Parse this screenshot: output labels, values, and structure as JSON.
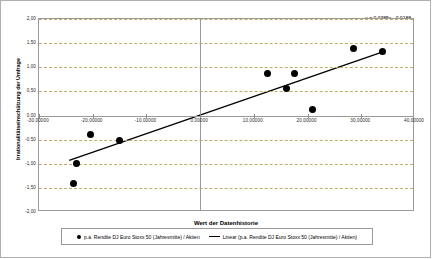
{
  "chart_data": {
    "type": "scatter",
    "title": "",
    "xlabel": "Wert der Datenhistorie",
    "ylabel": "Irrationalitätseinschätzung der Umfrage",
    "xlim": [
      -30,
      40
    ],
    "ylim": [
      -2.0,
      2.0
    ],
    "grid": true,
    "legend_position": "bottom",
    "xticks": [
      "-30,00000",
      "-20,00000",
      "-10,00000",
      "0,00000",
      "10,00000",
      "20,00000",
      "30,00000",
      "40,00000"
    ],
    "xtick_values": [
      -30,
      -20,
      -10,
      0,
      10,
      20,
      30,
      40
    ],
    "yticks": [
      "2,00",
      "1,50",
      "1,00",
      "0,50",
      "0,00",
      "-0,50",
      "-1,00",
      "-1,50",
      "-2,00"
    ],
    "ytick_values": [
      2.0,
      1.5,
      1.0,
      0.5,
      0.0,
      -0.5,
      -1.0,
      -1.5,
      -2.0
    ],
    "series": [
      {
        "name": "p.a. Rendite DJ Euro Stoxx 50 (Jahresmitte) / Aktien",
        "type": "scatter",
        "marker": "circle",
        "color": "#000000",
        "points": [
          {
            "x": -23.5,
            "y": -1.4
          },
          {
            "x": -23.0,
            "y": -1.0
          },
          {
            "x": -20.5,
            "y": -0.4
          },
          {
            "x": -15.0,
            "y": -0.52
          },
          {
            "x": 12.5,
            "y": 0.87
          },
          {
            "x": 16.0,
            "y": 0.55
          },
          {
            "x": 17.5,
            "y": 0.87
          },
          {
            "x": 21.0,
            "y": 0.12
          },
          {
            "x": 28.5,
            "y": 1.38
          },
          {
            "x": 34.0,
            "y": 1.32
          }
        ]
      },
      {
        "name": "Linear (p.a. Rendite DJ Euro Stoxx 50 (Jahresmitte) / Aktien)",
        "type": "line",
        "color": "#000000",
        "slope": 0.0385,
        "intercept": -0.0188,
        "x_start": -24.5,
        "x_end": 34.5
      }
    ],
    "annotations": {
      "equation": "y = 0,0385x - 0,0188",
      "r_squared_prefix": "R",
      "r_squared_exponent": "2",
      "r_squared_value": " = 0,8285"
    }
  },
  "legend": {
    "entries": [
      {
        "marker": "circle",
        "label": "p.a. Rendite DJ Euro Stoxx 50 (Jahresmitte) / Aktien"
      },
      {
        "marker": "line",
        "label": "Linear (p.a. Rendite DJ Euro Stoxx 50 (Jahresmitte) / Aktien)"
      }
    ]
  }
}
